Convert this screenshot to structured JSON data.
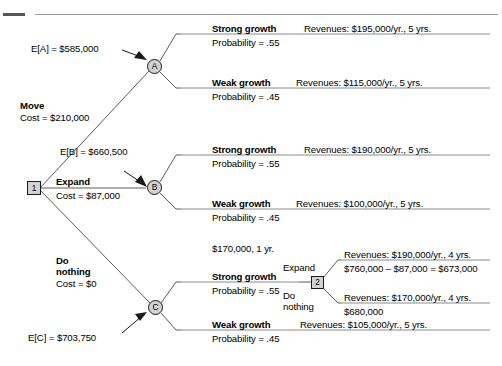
{
  "figure": {
    "root_node": "1",
    "chance_nodes": [
      "A",
      "B",
      "C"
    ],
    "second_decision_node": "2"
  },
  "decisions": {
    "move": {
      "label": "Move",
      "cost": "Cost = $210,000"
    },
    "expand": {
      "label": "Expand",
      "cost": "Cost = $87,000"
    },
    "do_nothing": {
      "label_line1": "Do",
      "label_line2": "nothing",
      "cost": "Cost = $0"
    }
  },
  "expected_values": {
    "a": "E[A] = $585,000",
    "b": "E[B] = $660,500",
    "c": "E[C] = $703,750"
  },
  "nodes": {
    "root": "1",
    "a": "A",
    "b": "B",
    "c": "C",
    "second": "2"
  },
  "branches": {
    "move": {
      "strong": {
        "name": "Strong growth",
        "probability": "Probability = .55",
        "outcome": "Revenues: $195,000/yr., 5 yrs."
      },
      "weak": {
        "name": "Weak growth",
        "probability": "Probability = .45",
        "outcome": "Revenues: $115,000/yr., 5 yrs."
      }
    },
    "expand": {
      "strong": {
        "name": "Strong growth",
        "probability": "Probability = .55",
        "outcome": "Revenues: $190,000/yr., 5 yrs."
      },
      "weak": {
        "name": "Weak growth",
        "probability": "Probability = .45",
        "outcome": "Revenues: $100,000/yr., 5 yrs."
      }
    },
    "do_nothing": {
      "interim": "$170,000, 1 yr.",
      "strong": {
        "name": "Strong growth",
        "probability": "Probability = .55"
      },
      "weak": {
        "name": "Weak growth",
        "probability": "Probability = .45",
        "outcome": "Revenues: $105,000/yr., 5 yrs."
      },
      "second_stage": {
        "expand": {
          "label": "Expand",
          "outcome": "Revenues: $190,000/yr., 4 yrs.",
          "value": "$760,000 – $87,000 = $673,000"
        },
        "do_nothing": {
          "label_line1": "Do",
          "label_line2": "nothing",
          "outcome": "Revenues: $170,000/yr., 4 yrs.",
          "value": "$680,000"
        }
      }
    }
  },
  "colors": {
    "node_fill": "#d2d2d2",
    "line": "#5a5a5a",
    "rule": "#8a8a8a",
    "text": "#000000"
  }
}
